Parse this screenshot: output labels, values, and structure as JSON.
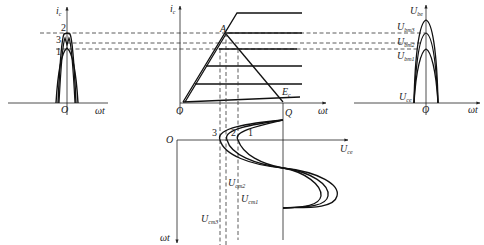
{
  "diagram": {
    "left_panel": {
      "y_axis": {
        "symbol": "i",
        "sub": "c"
      },
      "x_axis": "ωt",
      "origin": "O",
      "curve_labels": [
        "1",
        "2",
        "3"
      ]
    },
    "middle_panel": {
      "y_axis": {
        "symbol": "i",
        "sub": "c"
      },
      "x_axis": "ωt",
      "origin": "O",
      "point_A": "A",
      "point_Q": "Q",
      "E_label": {
        "symbol": "E",
        "sub": "c"
      }
    },
    "right_panel": {
      "y_axis": {
        "symbol": "U",
        "sub": "be"
      },
      "x_axis": "ωt",
      "origin": "O",
      "levels": [
        {
          "symbol": "U",
          "sub": "bm3"
        },
        {
          "symbol": "U",
          "sub": "bm2"
        },
        {
          "symbol": "U",
          "sub": "bm1"
        }
      ],
      "baseline": {
        "symbol": "U",
        "sub": "ce"
      }
    },
    "bottom_panel": {
      "origin": "O",
      "x_axis": {
        "symbol": "U",
        "sub": "ce"
      },
      "y_axis": "ωt",
      "curve_labels": [
        "3",
        "2",
        "1"
      ],
      "levels": [
        {
          "symbol": "U",
          "sub": "cm2"
        },
        {
          "symbol": "U",
          "sub": "cm1"
        },
        {
          "symbol": "U",
          "sub": "cm3"
        }
      ]
    }
  }
}
